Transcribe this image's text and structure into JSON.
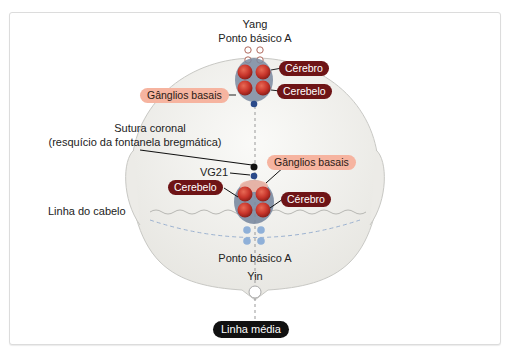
{
  "labels": {
    "top_yang": "Yang",
    "top_point": "Ponto básico A",
    "top_cerebro": "Cérebro",
    "top_cerebelo": "Cerebelo",
    "top_ganglios": "Gânglios basais",
    "sutura_line1": "Sutura coronal",
    "sutura_line2": "(resquício da fontanela bregmática)",
    "vg21": "VG21",
    "mid_ganglios": "Gânglios basais",
    "mid_cerebelo": "Cerebelo",
    "mid_cerebro": "Cérebro",
    "hairline": "Linha do cabelo",
    "bottom_point": "Ponto básico A",
    "bottom_yin": "Yin",
    "midline": "Linha média"
  },
  "colors": {
    "dark_label": "#6e1416",
    "salmon_label": "#f6b4a0",
    "red_point": "#c8352b",
    "blue_point": "#2a4a8a",
    "light_blue_point": "#8fb0d8",
    "head_fill": "#f1f0ec"
  }
}
